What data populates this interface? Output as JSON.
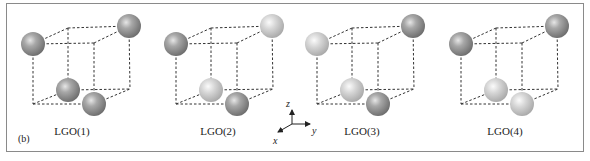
{
  "figure": {
    "panel_label": "(b)",
    "border_color": "#8a8a8a",
    "colors": {
      "dark_sphere": "#8c8c8c",
      "light_sphere": "#d4d4d4",
      "lines": "#333333"
    },
    "axes": {
      "z_label": "z",
      "y_label": "y",
      "x_label": "x"
    },
    "configurations": [
      {
        "label": "LGO(1)",
        "spheres": {
          "top_left_front": "dark",
          "top_right_back": "dark",
          "bottom_left_back": "dark",
          "bottom_right_front": "dark"
        }
      },
      {
        "label": "LGO(2)",
        "spheres": {
          "top_left_front": "dark",
          "top_right_back": "light",
          "bottom_left_back": "light",
          "bottom_right_front": "dark"
        }
      },
      {
        "label": "LGO(3)",
        "spheres": {
          "top_left_front": "light",
          "top_right_back": "dark",
          "bottom_left_back": "light",
          "bottom_right_front": "dark"
        }
      },
      {
        "label": "LGO(4)",
        "spheres": {
          "top_left_front": "dark",
          "top_right_back": "dark",
          "bottom_left_back": "light",
          "bottom_right_front": "light"
        }
      }
    ]
  }
}
